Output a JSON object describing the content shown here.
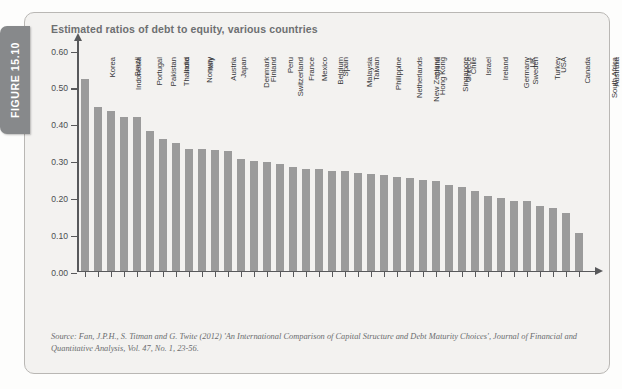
{
  "figure": {
    "tab_label": "FIGURE 15.10",
    "tab_color": "#87898b",
    "panel_bg": "#f3f2f0",
    "panel_border": "#b9b7b4"
  },
  "source": {
    "text": "Source: Fan, J.P.H., S. Titman and G. Twite (2012) 'An International Comparison of Capital Structure and Debt Maturity Choices', Journal of Financial and Quantitative Analysis, Vol. 47, No. 1, 23-56."
  },
  "chart_data": {
    "type": "bar",
    "title": "Estimated ratios of debt to equity, various countries",
    "xlabel": "",
    "ylabel": "",
    "ylim": [
      0.0,
      0.6
    ],
    "yticks": [
      "0.00",
      "0.10",
      "0.20",
      "0.30",
      "0.40",
      "0.50",
      "0.60"
    ],
    "ytick_values": [
      0.0,
      0.1,
      0.2,
      0.3,
      0.4,
      0.5,
      0.6
    ],
    "grid": false,
    "legend": "none",
    "bar_color": "#9b9b9b",
    "axis_color": "#58595b",
    "categories": [
      "Korea",
      "Indonesia",
      "Brazil",
      "Portugal",
      "Pakistan",
      "Thailand",
      "India",
      "Norway",
      "Italy",
      "Austria",
      "Japan",
      "Denmark",
      "Finland",
      "Switzerland",
      "Peru",
      "France",
      "Mexico",
      "Belgium",
      "Spain",
      "Malaysia",
      "Taiwan",
      "Philippine",
      "Netherlands",
      "New Zealand",
      "Hong Kong",
      "China",
      "Singapore",
      "Greece",
      "Chile",
      "Israel",
      "Ireland",
      "Germany",
      "Sweden",
      "UK",
      "Turkey",
      "USA",
      "Canada",
      "South Africa",
      "Australia"
    ],
    "values": [
      0.52,
      0.445,
      0.433,
      0.418,
      0.418,
      0.38,
      0.357,
      0.345,
      0.331,
      0.33,
      0.327,
      0.324,
      0.304,
      0.298,
      0.295,
      0.288,
      0.281,
      0.276,
      0.276,
      0.271,
      0.269,
      0.266,
      0.262,
      0.258,
      0.254,
      0.251,
      0.247,
      0.243,
      0.232,
      0.226,
      0.217,
      0.203,
      0.196,
      0.19,
      0.189,
      0.174,
      0.171,
      0.156,
      0.101
    ]
  }
}
